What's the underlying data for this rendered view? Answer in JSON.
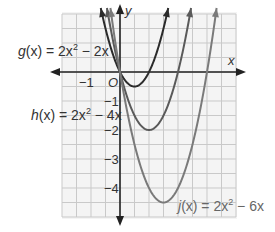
{
  "chart_data": {
    "type": "line",
    "title": "",
    "xlabel": "x",
    "ylabel": "y",
    "xlim": [
      -2,
      4
    ],
    "ylim": [
      -5,
      2
    ],
    "grid": true,
    "grid_step": 0.5,
    "x_tick_labels": [
      {
        "value": -1,
        "label": "−1"
      }
    ],
    "y_tick_labels": [
      {
        "value": -1,
        "label": "−1"
      },
      {
        "value": -2,
        "label": "−2"
      },
      {
        "value": -3,
        "label": "−3"
      },
      {
        "value": -4,
        "label": "−4"
      }
    ],
    "origin_label": "O",
    "series": [
      {
        "name": "g(x) = 2x² − 2x",
        "a": 2,
        "b": -2,
        "c": 0,
        "vertex": [
          0.5,
          -0.5
        ],
        "zeros": [
          0,
          1
        ],
        "color": "#2b2b2b"
      },
      {
        "name": "h(x) = 2x² − 4x",
        "a": 2,
        "b": -4,
        "c": 0,
        "vertex": [
          1,
          -2
        ],
        "zeros": [
          0,
          2
        ],
        "color": "#5a5a5a"
      },
      {
        "name": "j(x) = 2x² − 6x",
        "a": 2,
        "b": -6,
        "c": 0,
        "vertex": [
          1.5,
          -4.5
        ],
        "zeros": [
          0,
          3
        ],
        "color": "#7a7a7a"
      }
    ]
  },
  "labels": {
    "g": {
      "prefix": "g",
      "arg": "(x) = 2x",
      "exp": "2",
      "suffix": " − 2x"
    },
    "h": {
      "prefix": "h",
      "arg": "(x) = 2x",
      "exp": "2",
      "suffix": " − 4x"
    },
    "j": {
      "prefix": "j",
      "arg": "(x) = 2x",
      "exp": "2",
      "suffix": " − 6x"
    },
    "x_axis": "x",
    "y_axis": "y",
    "origin": "O",
    "x_tick_neg1": "−1",
    "y_tick_neg1": "−1",
    "y_tick_neg2": "−2",
    "y_tick_neg3": "−3",
    "y_tick_neg4": "−4"
  }
}
